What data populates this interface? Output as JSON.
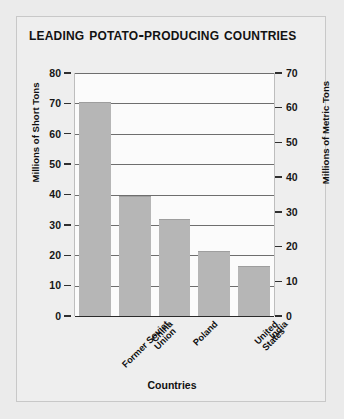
{
  "chart_data": {
    "type": "bar",
    "title": "Leading Potato-Producing Countries",
    "xlabel": "Countries",
    "ylabel": "Millions of Short Tons",
    "ylabel_secondary": "Millions of Metric Tons",
    "categories": [
      "Former Soviet\nUnion",
      "China",
      "Poland",
      "United States",
      "India"
    ],
    "values": [
      70.5,
      39.5,
      32.0,
      21.5,
      16.5
    ],
    "ylim": [
      0,
      80
    ],
    "yticks": [
      80,
      70,
      60,
      50,
      40,
      30,
      20,
      10,
      0
    ],
    "ylim_secondary": [
      0,
      70
    ],
    "yticks_secondary": [
      70,
      60,
      50,
      40,
      30,
      20,
      10,
      0
    ],
    "grid": true,
    "legend": "none",
    "bar_color": "#b6b6b6",
    "plot_background": "#fbfbfb",
    "panel_background": "#eeeeee",
    "gridline_color": "#6e6e6e"
  },
  "axis": {
    "left_ticks": [
      "80",
      "70",
      "60",
      "50",
      "40",
      "30",
      "20",
      "10",
      "0"
    ],
    "right_ticks": [
      "70",
      "60",
      "50",
      "40",
      "30",
      "20",
      "10",
      "0"
    ]
  }
}
